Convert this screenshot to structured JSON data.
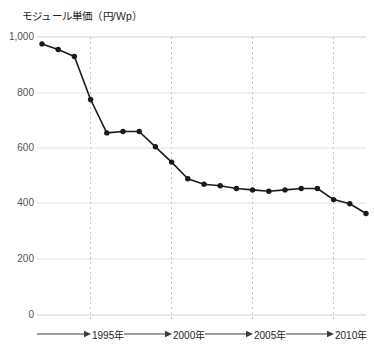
{
  "chart_data": {
    "type": "line",
    "title": "モジュール単価（円/Wp）",
    "xlabel": "",
    "ylabel": "モジュール単価（円/Wp）",
    "ylim": [
      0,
      1000
    ],
    "yticks": [
      0,
      200,
      400,
      600,
      800,
      1000
    ],
    "ytick_labels": [
      "0",
      "200",
      "400",
      "600",
      "800",
      "1,000"
    ],
    "xtick_labels": [
      "1995年",
      "2000年",
      "2005年",
      "2010年"
    ],
    "xticks": [
      1995,
      2000,
      2005,
      2010
    ],
    "xlim": [
      1992,
      2012
    ],
    "grid": "vertical dashed at xticks, horizontal solid at yticks",
    "legend": "none",
    "x": [
      1992,
      1993,
      1994,
      1995,
      1996,
      1997,
      1998,
      1999,
      2000,
      2001,
      2002,
      2003,
      2004,
      2005,
      2006,
      2007,
      2008,
      2009,
      2010,
      2011,
      2012
    ],
    "values": [
      975,
      955,
      930,
      775,
      655,
      660,
      660,
      605,
      550,
      490,
      470,
      465,
      455,
      450,
      445,
      450,
      455,
      455,
      415,
      400,
      365
    ],
    "series": [
      {
        "name": "モジュール単価",
        "values": [
          975,
          955,
          930,
          775,
          655,
          660,
          660,
          605,
          550,
          490,
          470,
          465,
          455,
          450,
          445,
          450,
          455,
          455,
          415,
          400,
          365
        ]
      }
    ],
    "marker": "filled-circle",
    "line_color": "#1a1a1a",
    "marker_color": "#1a1a1a",
    "grid_color": "#d9d9d9",
    "gridline_dashed_color": "#c9c9c9"
  }
}
